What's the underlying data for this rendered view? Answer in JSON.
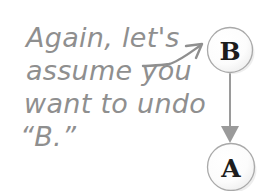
{
  "canvas": {
    "width": 279,
    "height": 191,
    "background": "#ffffff"
  },
  "annotation": {
    "name": "handwritten-note",
    "color": "#8f8f8f",
    "lines": [
      "Again, let's",
      "assume you",
      "want to undo",
      "“B.”"
    ],
    "full_text": "Again, let's assume you want to undo “B.”"
  },
  "pointer_arrow": {
    "name": "curved-pointer-arrow",
    "color": "#8f8f8f",
    "from": "annotation",
    "to": "node-b",
    "direction": "up-right"
  },
  "diagram": {
    "name": "commit-stack",
    "node_fill": "#fbfbfb",
    "node_stroke": "#a9a9a9",
    "letter_color": "#1d1d1d",
    "nodes": [
      {
        "id": "node-b",
        "label": "B",
        "cx": 230,
        "cy": 50,
        "r": 23
      },
      {
        "id": "node-a",
        "label": "A",
        "cx": 231,
        "cy": 167,
        "r": 24
      }
    ],
    "edges": [
      {
        "id": "edge-b-to-a",
        "from": "node-b",
        "to": "node-a",
        "color": "#9a9a9a",
        "arrowhead": "solid-triangle"
      }
    ]
  }
}
